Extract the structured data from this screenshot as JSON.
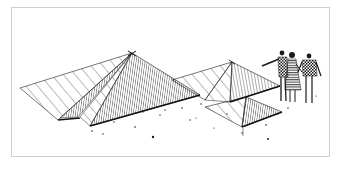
{
  "illustration": {
    "subject": "Pen-and-ink sketch of three pyramid-shaped structures with three people standing at right",
    "style": "black ink hatching on white",
    "colors": {
      "ink": "#1a1a1a",
      "paper": "#ffffff",
      "frame": "#cfcfcf"
    },
    "elements": {
      "pyramids": [
        {
          "name": "large pyramid",
          "position": "left"
        },
        {
          "name": "medium pyramid",
          "position": "center-right"
        },
        {
          "name": "small pyramid",
          "position": "front-right"
        }
      ],
      "figures": [
        {
          "name": "man pointing",
          "position": "left of group"
        },
        {
          "name": "woman in striped dress",
          "position": "middle of group"
        },
        {
          "name": "man in checkered sweater",
          "position": "right of group"
        }
      ]
    }
  }
}
